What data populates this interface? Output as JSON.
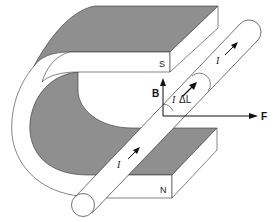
{
  "colors": {
    "magnet_face": "#8f8f8f",
    "magnet_side": "#ffffff",
    "outline": "#333333",
    "background": "#ffffff"
  },
  "labels": {
    "south_pole": "S",
    "north_pole": "N",
    "field": "B",
    "force": "F",
    "current_top": "I",
    "current_bottom": "I",
    "segment_current": "I",
    "segment_length": "ΔL"
  },
  "vectors": [
    {
      "name": "B",
      "direction": "up"
    },
    {
      "name": "F",
      "direction": "right"
    },
    {
      "name": "I ΔL",
      "direction": "along wire, up-right"
    }
  ]
}
